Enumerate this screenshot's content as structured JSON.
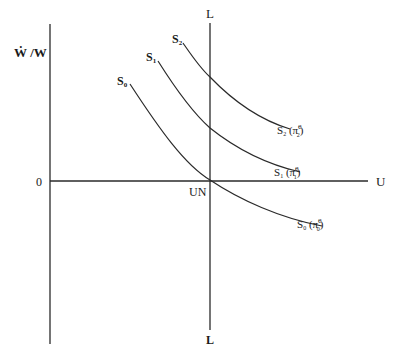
{
  "diagram": {
    "type": "economics-phillips-curve",
    "axes": {
      "y_label": "Ẇ /W",
      "x_label": "U",
      "origin_label": "0",
      "vertical_line_top_label": "L",
      "vertical_line_bottom_label": "L",
      "intersection_label": "UN"
    },
    "curves": [
      {
        "id": "S0",
        "label": "S",
        "sub": "0",
        "end_label_pi_sub": "0",
        "end_label_sup": "e"
      },
      {
        "id": "S1",
        "label": "S",
        "sub": "1",
        "end_label_pi_sub": "1",
        "end_label_sup": "e"
      },
      {
        "id": "S2",
        "label": "S",
        "sub": "2",
        "end_label_pi_sub": "2",
        "end_label_sup": "e"
      }
    ],
    "colors": {
      "line": "#2a2a2a",
      "text": "#1a1a1a",
      "background": "#ffffff"
    }
  }
}
